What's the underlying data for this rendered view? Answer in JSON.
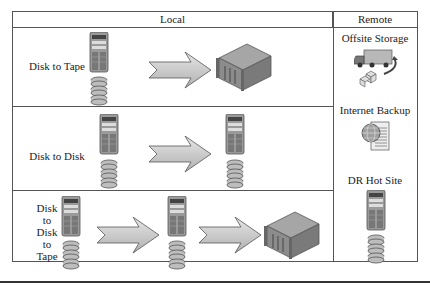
{
  "headers": {
    "local": "Local",
    "remote": "Remote"
  },
  "rows": [
    {
      "label": "Disk to Tape",
      "flow": [
        "server-with-disks",
        "arrow",
        "tape-library"
      ]
    },
    {
      "label": "Disk to Disk",
      "flow": [
        "server-with-disks",
        "arrow",
        "server-with-disks"
      ]
    },
    {
      "label_lines": [
        "Disk",
        "to",
        "Disk",
        "to",
        "Tape"
      ],
      "flow": [
        "server-with-disks",
        "arrow",
        "server-with-disks",
        "arrow",
        "tape-library"
      ]
    }
  ],
  "remote": [
    {
      "label": "Offsite Storage",
      "icon": "truck-boxes"
    },
    {
      "label": "Internet Backup",
      "icon": "globe-document"
    },
    {
      "label": "DR Hot Site",
      "icon": "server-with-disks"
    }
  ],
  "colors": {
    "border": "#555555",
    "arrow_fill": "#c8c8c8",
    "device_fill": "#8a8a8a"
  }
}
